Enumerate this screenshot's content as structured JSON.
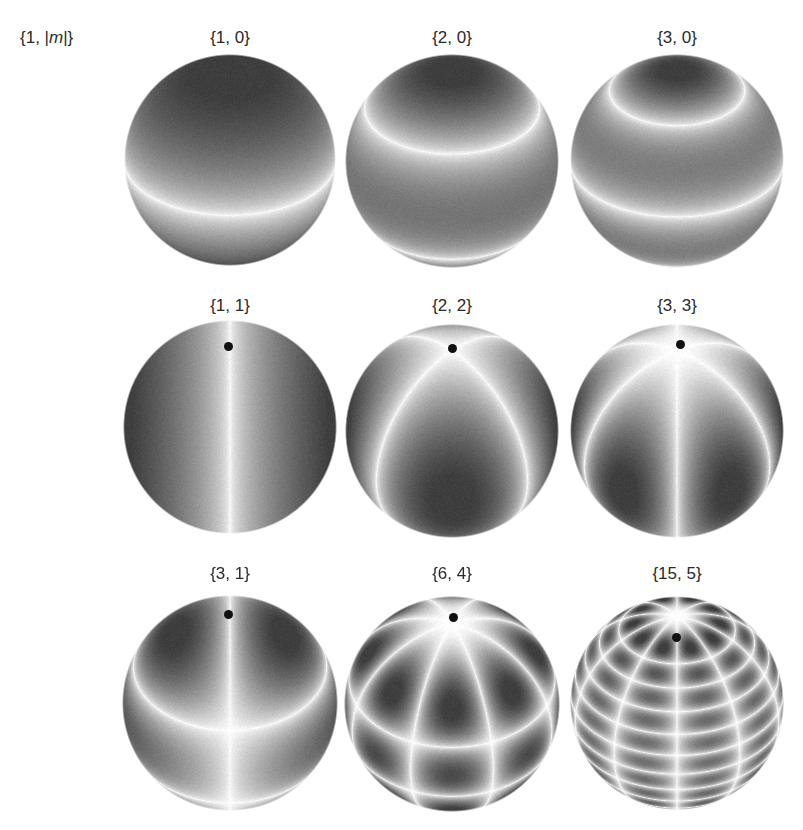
{
  "figure": {
    "corner_label_prefix": "{1, |",
    "corner_label_var": "m",
    "corner_label_suffix": "|}",
    "panels": [
      {
        "label": "{1, 0}",
        "l": 1,
        "m": 0,
        "cx": 230,
        "cy": 160,
        "r": 106,
        "pole_dot": false
      },
      {
        "label": "{2, 0}",
        "l": 2,
        "m": 0,
        "cx": 452,
        "cy": 161,
        "r": 107,
        "pole_dot": false
      },
      {
        "label": "{3, 0}",
        "l": 3,
        "m": 0,
        "cx": 677,
        "cy": 161,
        "r": 107,
        "pole_dot": false
      },
      {
        "label": "{1, 1}",
        "l": 1,
        "m": 1,
        "cx": 230,
        "cy": 427,
        "r": 107,
        "pole_dot": true,
        "dot_x": 228,
        "dot_y": 346
      },
      {
        "label": "{2, 2}",
        "l": 2,
        "m": 2,
        "cx": 452,
        "cy": 431,
        "r": 107,
        "pole_dot": true,
        "dot_x": 452,
        "dot_y": 348
      },
      {
        "label": "{3, 3}",
        "l": 3,
        "m": 3,
        "cx": 677,
        "cy": 431,
        "r": 107,
        "pole_dot": true,
        "dot_x": 680,
        "dot_y": 344
      },
      {
        "label": "{3, 1}",
        "l": 3,
        "m": 1,
        "cx": 230,
        "cy": 703,
        "r": 108,
        "pole_dot": true,
        "dot_x": 228,
        "dot_y": 614
      },
      {
        "label": "{6, 4}",
        "l": 6,
        "m": 4,
        "cx": 452,
        "cy": 704,
        "r": 108,
        "pole_dot": true,
        "dot_x": 453,
        "dot_y": 617
      },
      {
        "label": "{15, 5}",
        "l": 15,
        "m": 5,
        "cx": 677,
        "cy": 703,
        "r": 107,
        "pole_dot": true,
        "dot_x": 676,
        "dot_y": 637
      }
    ],
    "label_positions_y": [
      28,
      296,
      564
    ],
    "colors": {
      "dark": "#3d3d3d",
      "mid": "#9a9a9a",
      "light": "#ffffff",
      "dot": "#111111",
      "text": "#2a2a2a"
    }
  }
}
